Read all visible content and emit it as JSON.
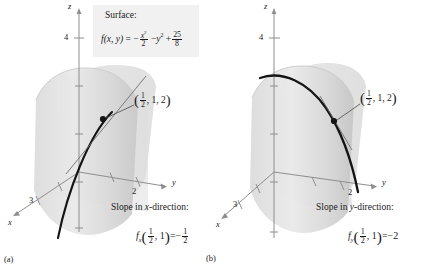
{
  "figure": {
    "surface_box": {
      "title": "Surface:",
      "equation_plain": "f(x, y) = -x^2/2 - y^2 + 25/8",
      "fn_name": "f",
      "fn_args": "(x, y)",
      "equals": "=",
      "minus": "−",
      "plus": "+",
      "term1_num": "x",
      "term1_exp": "2",
      "term1_den": "2",
      "term2": "y",
      "term2_exp": "2",
      "term3_num": "25",
      "term3_den": "8"
    },
    "panels": [
      {
        "id": "a",
        "fignum": "(a)",
        "axes": {
          "z_label": "z",
          "y_label": "y",
          "x_label": "x",
          "z_tick": "4",
          "y_tick": "2",
          "x_tick": "3"
        },
        "point_label": {
          "open": "(",
          "frac_num": "1",
          "frac_den": "2",
          "rest": ", 1, 2",
          "close": ")",
          "plain": "(1/2, 1, 2)"
        },
        "slope_caption": "Slope in x-direction:",
        "slope_caption_pre": "Slope in ",
        "slope_caption_var": "x",
        "slope_caption_post": "-direction:",
        "slope_equation": {
          "fn": "f",
          "subscript": "x",
          "open": "(",
          "arg_frac_num": "1",
          "arg_frac_den": "2",
          "arg_rest": ", 1",
          "close": ")",
          "equals": "=",
          "minus": "−",
          "val_num": "1",
          "val_den": "2",
          "plain": "f_x(1/2, 1) = -1/2"
        }
      },
      {
        "id": "b",
        "fignum": "(b)",
        "axes": {
          "z_label": "z",
          "y_label": "y",
          "x_label": "x",
          "z_tick": "4",
          "y_tick": "2",
          "x_tick": "3"
        },
        "point_label": {
          "open": "(",
          "frac_num": "1",
          "frac_den": "2",
          "rest": ", 1, 2",
          "close": ")",
          "plain": "(1/2, 1, 2)"
        },
        "slope_caption": "Slope in y-direction:",
        "slope_caption_pre": "Slope in ",
        "slope_caption_var": "y",
        "slope_caption_post": "-direction:",
        "slope_equation": {
          "fn": "f",
          "subscript": "y",
          "open": "(",
          "arg_frac_num": "1",
          "arg_frac_den": "2",
          "arg_rest": ", 1",
          "close": ")",
          "equals": "=",
          "minus": "−",
          "value": "2",
          "plain": "f_y(1/2, 1) = -2"
        }
      }
    ],
    "colors": {
      "surface_light": "#e6e6e6",
      "surface_mid": "#d6d6d6",
      "surface_dark": "#c4c4c4",
      "plane": "#cfcfcf",
      "curve": "#141414",
      "axis": "#8e8e8e",
      "box_bg": "#f1f1f1",
      "text": "#1a1a1a"
    }
  }
}
